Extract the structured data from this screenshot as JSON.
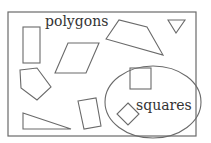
{
  "diagram": {
    "type": "venn-set-diagram",
    "universe": {
      "label": "polygons",
      "shapes": [
        {
          "name": "tall-rectangle"
        },
        {
          "name": "parallelogram"
        },
        {
          "name": "irregular-quadrilateral"
        },
        {
          "name": "inverted-triangle"
        },
        {
          "name": "pentagon"
        },
        {
          "name": "right-triangle"
        },
        {
          "name": "slanted-quadrilateral"
        }
      ]
    },
    "subset": {
      "label": "squares",
      "shapes": [
        {
          "name": "square"
        },
        {
          "name": "rotated-square"
        }
      ]
    },
    "colors": {
      "stroke": "#6a6a6a",
      "text": "#333333",
      "background": "#ffffff"
    }
  }
}
